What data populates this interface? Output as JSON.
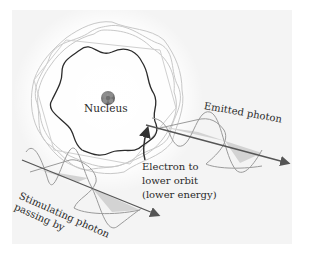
{
  "diagram": {
    "labels": {
      "nucleus": "Nucleus",
      "emitted_photon": "Emitted photon",
      "electron_transition": "Electron to\nlower orbit\n(lower energy)",
      "stimulating_photon": "Stimulating photon\npassing by"
    },
    "colors": {
      "panel_background": "#f4f4f4",
      "glow": "#ffffff",
      "inner_orbit": "#2b2b2b",
      "outer_orbits": "#c8c8c8",
      "wave_lines": "#9a9a9a",
      "wave_fill": "#cfcfcf",
      "axis_arrow": "#555555",
      "nucleus": "#7a7a7a"
    },
    "elements": [
      {
        "id": "nucleus",
        "shape": "circle",
        "center": [
          108,
          98
        ]
      },
      {
        "id": "lower-orbit",
        "shape": "wavy-ring",
        "lobes": 6,
        "stroke": "dark"
      },
      {
        "id": "higher-orbits",
        "shape": "wavy-ring",
        "count": 3,
        "stroke": "light"
      },
      {
        "id": "electron-transition-arrow",
        "from": [
          146,
          160
        ],
        "to": [
          147,
          128
        ]
      },
      {
        "id": "emitted-photon-wave",
        "axis_from": [
          146,
          125
        ],
        "axis_to": [
          288,
          162
        ]
      },
      {
        "id": "stimulating-photon-wave",
        "axis_from": [
          22,
          160
        ],
        "axis_to": [
          158,
          215
        ]
      }
    ]
  }
}
